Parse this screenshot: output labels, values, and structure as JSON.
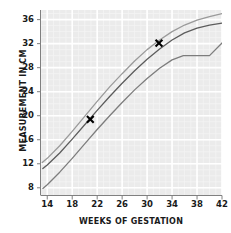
{
  "chart_data": {
    "type": "line",
    "title": "",
    "xlabel": "WEEKS OF GESTATION",
    "ylabel": "MEASUREMENT IN CM",
    "xlim": [
      13,
      42
    ],
    "ylim": [
      6.8,
      37.6
    ],
    "xticks": [
      14,
      18,
      22,
      26,
      30,
      34,
      38,
      42
    ],
    "yticks": [
      8,
      12,
      16,
      20,
      24,
      28,
      32,
      36
    ],
    "grid": true,
    "legend": "none",
    "background": "#ebebeb",
    "gridline_color": "#ffffff",
    "series": [
      {
        "name": "upper-percentile-curve",
        "color": "#9a9a9a",
        "x": [
          13.2,
          14,
          16,
          18,
          20,
          22,
          24,
          26,
          28,
          30,
          32,
          34,
          36,
          38,
          40,
          42
        ],
        "values": [
          12.2,
          12.9,
          15.0,
          17.4,
          19.9,
          22.4,
          24.8,
          27.0,
          29.1,
          31.0,
          32.6,
          34.0,
          35.1,
          35.9,
          36.5,
          37.0
        ]
      },
      {
        "name": "median-curve",
        "color": "#5c5c5c",
        "x": [
          13.3,
          14,
          16,
          18,
          20,
          22,
          24,
          26,
          28,
          30,
          32,
          34,
          36,
          38,
          40,
          42
        ],
        "values": [
          11.2,
          11.8,
          13.8,
          16.1,
          18.5,
          20.9,
          23.2,
          25.4,
          27.5,
          29.4,
          31.1,
          32.6,
          33.8,
          34.6,
          35.1,
          35.4
        ]
      },
      {
        "name": "lower-percentile-curve",
        "color": "#7d7d7d",
        "x": [
          13.3,
          14,
          16,
          18,
          20,
          22,
          24,
          26,
          28,
          30,
          32,
          34,
          35.8,
          40,
          42
        ],
        "values": [
          7.9,
          8.5,
          10.6,
          12.9,
          15.3,
          17.7,
          20.0,
          22.2,
          24.3,
          26.2,
          27.9,
          29.3,
          30.0,
          30.0,
          32.1
        ]
      }
    ],
    "markers": [
      {
        "name": "measurement-point-1",
        "x": 20.9,
        "y": 19.4,
        "symbol": "x",
        "color": "#000000"
      },
      {
        "name": "measurement-point-2",
        "x": 31.9,
        "y": 32.1,
        "symbol": "x",
        "color": "#000000"
      }
    ]
  }
}
